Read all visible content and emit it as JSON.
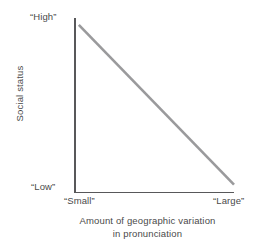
{
  "chart_data": {
    "type": "line",
    "title": "",
    "subtitle": "",
    "xlabel_line1": "Amount of geographic variation",
    "xlabel_line2": "in pronunciation",
    "ylabel": "Social status",
    "x_tick_labels": [
      "“Small”",
      "“Large”"
    ],
    "y_tick_labels": [
      "“High”",
      "“Low”"
    ],
    "x_tick_left_label": "“Small”",
    "x_tick_right_label": "“Large”",
    "y_tick_top_label": "“High”",
    "y_tick_bottom_label": "“Low”",
    "x": [
      0.03,
      1.0
    ],
    "values": [
      0.96,
      0.04
    ],
    "series": [
      {
        "name": "social status vs geographic variation",
        "x": [
          0.03,
          1.0
        ],
        "values": [
          0.96,
          0.04
        ]
      }
    ],
    "xlim": [
      0,
      1
    ],
    "ylim": [
      0,
      1
    ],
    "grid": false,
    "legend": false,
    "legend_position": "none",
    "annotations": [],
    "line_color": "#9a9a9c",
    "axis_color": "#58585a",
    "background_color": "#ffffff",
    "text_color": "#4a4a4a"
  }
}
